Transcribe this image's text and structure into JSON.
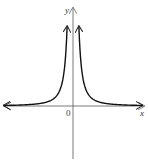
{
  "chart_data": {
    "type": "line",
    "title": "",
    "function": "y = 1/x^2",
    "xlabel": "x",
    "ylabel": "y",
    "origin_label": "0",
    "xlim": [
      -5,
      5
    ],
    "ylim": [
      -4,
      7.5
    ],
    "series": [
      {
        "name": "left-branch",
        "x": [
          -5,
          -4,
          -3,
          -2,
          -1.5,
          -1,
          -0.75,
          -0.55,
          -0.42
        ],
        "y": [
          0.04,
          0.0625,
          0.111,
          0.25,
          0.444,
          1,
          1.778,
          3.306,
          5.669
        ]
      },
      {
        "name": "right-branch",
        "x": [
          0.42,
          0.55,
          0.75,
          1,
          1.5,
          2,
          3,
          4,
          5
        ],
        "y": [
          5.669,
          3.306,
          1.778,
          1,
          0.444,
          0.25,
          0.111,
          0.0625,
          0.04
        ]
      }
    ],
    "grid": false,
    "legend": "none",
    "colors": {
      "curve": "#111111",
      "axis": "#555555"
    }
  }
}
